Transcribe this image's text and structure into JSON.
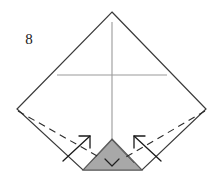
{
  "figure": {
    "kind": "origami-folding-diagram",
    "step_number": "8",
    "width": 222,
    "height": 176,
    "background_color": "#ffffff"
  },
  "colors": {
    "outline": "#3a3a3a",
    "crease_line": "#9a9a9a",
    "fold_dashed": "#2b2b2b",
    "arrow": "#1a1a1a",
    "shaded_fill": "#a8a8a8",
    "shaded_stroke": "#5a5a5a",
    "paper_fill": "#ffffff"
  },
  "geometry": {
    "diamond": {
      "top": [
        112,
        12
      ],
      "left": [
        17,
        109
      ],
      "right": [
        206,
        109
      ],
      "bottom_left": [
        83,
        170
      ],
      "bottom_right": [
        142,
        170
      ]
    },
    "vertical_crease": {
      "x": 112,
      "y1": 22,
      "y2": 170
    },
    "horizontal_crease": {
      "y": 75,
      "x1": 57,
      "x2": 167
    },
    "shaded_triangle": {
      "apex": [
        112,
        139
      ],
      "base_left": [
        83,
        170
      ],
      "base_right": [
        142,
        170
      ]
    },
    "inner_creases": [
      {
        "from": [
          112,
          139
        ],
        "to": [
          90,
          163
        ]
      },
      {
        "from": [
          112,
          139
        ],
        "to": [
          134,
          163
        ]
      }
    ],
    "down_arrow": {
      "x": 112,
      "tip_y": 166,
      "head_width": 14
    },
    "dashed_fold_left": {
      "from": [
        18,
        111
      ],
      "to": [
        99,
        157
      ]
    },
    "dashed_fold_right": {
      "from": [
        205,
        111
      ],
      "to": [
        126,
        157
      ]
    },
    "arrow_left": {
      "from": [
        63,
        160
      ],
      "to": [
        91,
        136
      ]
    },
    "arrow_right": {
      "from": [
        161,
        160
      ],
      "to": [
        133,
        136
      ]
    }
  },
  "labels": {
    "step_number": "8",
    "step_number_position": [
      29,
      44
    ]
  },
  "elements": {
    "step_number_name": "step-number-label",
    "outline_name": "paper-outline",
    "shaded_name": "shaded-fold-flap",
    "left_arrow_name": "fold-arrow-left",
    "right_arrow_name": "fold-arrow-right",
    "down_arrow_name": "fold-arrow-down"
  }
}
